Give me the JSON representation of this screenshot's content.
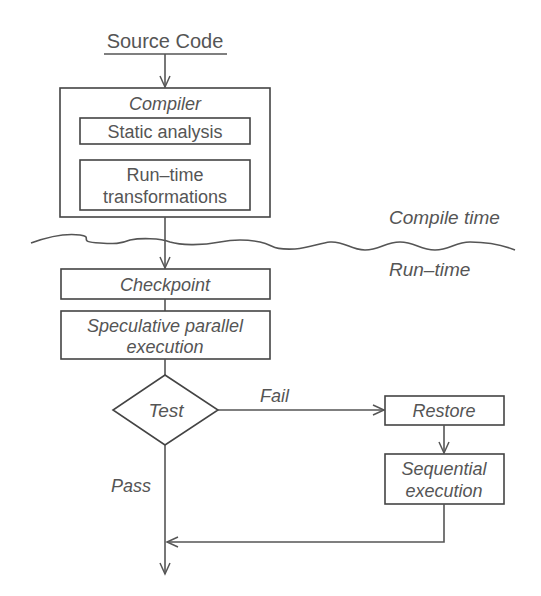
{
  "diagram": {
    "type": "flowchart",
    "source": {
      "label": "Source Code"
    },
    "compiler": {
      "title": "Compiler",
      "steps": [
        {
          "label": "Static analysis"
        },
        {
          "label_line1": "Run–time",
          "label_line2": "transformations"
        }
      ]
    },
    "phases": {
      "compile": "Compile time",
      "run": "Run–time"
    },
    "checkpoint": {
      "label": "Checkpoint"
    },
    "speculative": {
      "line1": "Speculative parallel",
      "line2": "execution"
    },
    "test": {
      "label": "Test"
    },
    "edges": {
      "fail": "Fail",
      "pass": "Pass"
    },
    "restore": {
      "label": "Restore"
    },
    "sequential": {
      "line1": "Sequential",
      "line2": "execution"
    },
    "colors": {
      "stroke": "#555555",
      "text": "#555555",
      "background": "#ffffff"
    }
  }
}
